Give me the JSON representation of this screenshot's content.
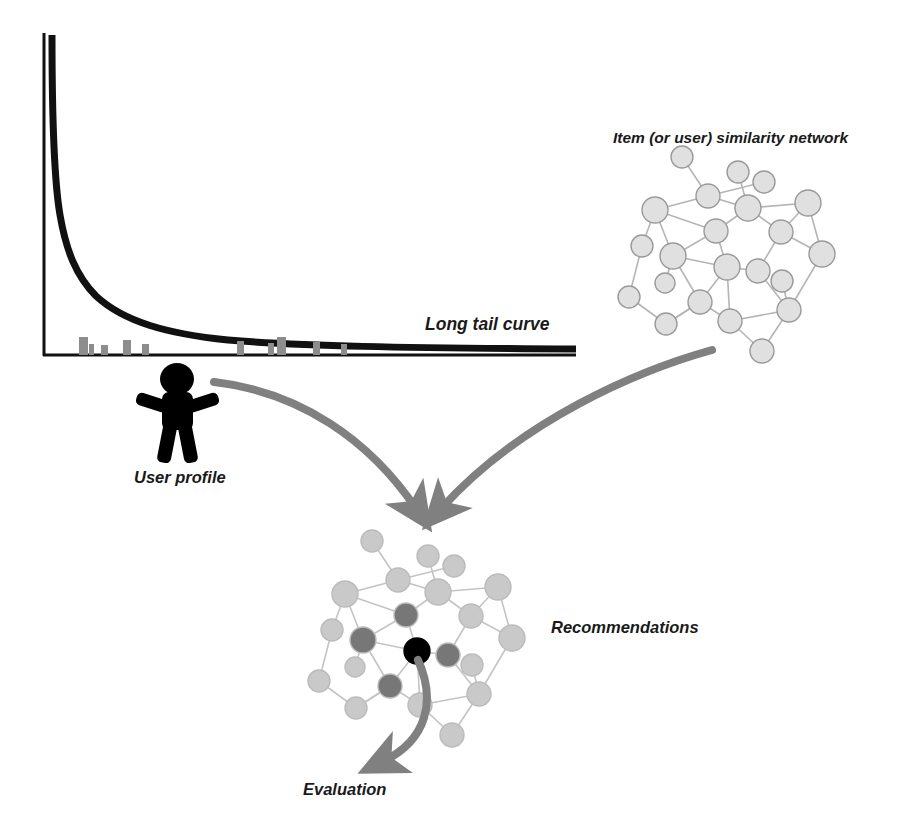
{
  "diagram": {
    "background_color": "#ffffff",
    "label_color": "#1a1a1a",
    "arrow_color": "#808080",
    "node_fill": "#e0e0e0",
    "node_stroke": "#9a9a9a",
    "node_fill_recommended": "#c9c9c9",
    "node_fill_highlight": "#777777",
    "node_fill_seed": "#000000",
    "edge_color": "#b5b5b5",
    "curve_color": "#111111",
    "bar_color": "#8d8d8d",
    "figure_color": "#000000"
  },
  "labels": {
    "long_tail_curve": "Long tail curve",
    "user_profile": "User profile",
    "similarity_network": "Item (or user) similarity network",
    "recommendations": "Recommendations",
    "evaluation": "Evaluation"
  },
  "chart_data": {
    "type": "line",
    "title": "Long tail curve",
    "xlabel": "",
    "ylabel": "",
    "grid": false,
    "legend": "none",
    "xlim": [
      0,
      100
    ],
    "ylim": [
      0,
      100
    ],
    "series": [
      {
        "name": "Long tail curve",
        "x": [
          1,
          2,
          3,
          4,
          5,
          6,
          8,
          10,
          13,
          17,
          22,
          28,
          35,
          45,
          58,
          72,
          85,
          100
        ],
        "y": [
          100,
          62,
          40,
          28,
          21,
          17,
          12,
          9.5,
          7.5,
          6.2,
          5.4,
          4.8,
          4.3,
          3.9,
          3.5,
          3.2,
          3.0,
          2.8
        ]
      }
    ],
    "histogram": {
      "name": "User profile ratings",
      "x": [
        8,
        10,
        14,
        21,
        25,
        43,
        50,
        52,
        64,
        71
      ],
      "values": [
        7.5,
        4.0,
        3.0,
        5.5,
        3.5,
        5.0,
        4.0,
        7.0,
        4.5,
        3.5
      ]
    }
  },
  "similarity_network": {
    "name": "Item (or user) similarity network",
    "node_count": 22,
    "nodes": [
      {
        "id": 0,
        "x": 682,
        "y": 157,
        "r": 11,
        "state": "normal"
      },
      {
        "id": 1,
        "x": 738,
        "y": 172,
        "r": 11,
        "state": "normal"
      },
      {
        "id": 2,
        "x": 708,
        "y": 196,
        "r": 12,
        "state": "normal"
      },
      {
        "id": 3,
        "x": 764,
        "y": 182,
        "r": 11,
        "state": "normal"
      },
      {
        "id": 4,
        "x": 655,
        "y": 210,
        "r": 13,
        "state": "normal"
      },
      {
        "id": 5,
        "x": 748,
        "y": 208,
        "r": 13,
        "state": "normal"
      },
      {
        "id": 6,
        "x": 808,
        "y": 203,
        "r": 13,
        "state": "normal"
      },
      {
        "id": 7,
        "x": 716,
        "y": 231,
        "r": 12,
        "state": "normal"
      },
      {
        "id": 8,
        "x": 781,
        "y": 232,
        "r": 12,
        "state": "normal"
      },
      {
        "id": 9,
        "x": 642,
        "y": 246,
        "r": 11,
        "state": "normal"
      },
      {
        "id": 10,
        "x": 673,
        "y": 256,
        "r": 13,
        "state": "normal"
      },
      {
        "id": 11,
        "x": 727,
        "y": 267,
        "r": 13,
        "state": "normal"
      },
      {
        "id": 12,
        "x": 758,
        "y": 271,
        "r": 12,
        "state": "normal"
      },
      {
        "id": 13,
        "x": 822,
        "y": 254,
        "r": 13,
        "state": "normal"
      },
      {
        "id": 14,
        "x": 665,
        "y": 283,
        "r": 10,
        "state": "normal"
      },
      {
        "id": 15,
        "x": 629,
        "y": 297,
        "r": 11,
        "state": "normal"
      },
      {
        "id": 16,
        "x": 700,
        "y": 302,
        "r": 12,
        "state": "normal"
      },
      {
        "id": 17,
        "x": 782,
        "y": 281,
        "r": 11,
        "state": "normal"
      },
      {
        "id": 18,
        "x": 789,
        "y": 310,
        "r": 12,
        "state": "normal"
      },
      {
        "id": 19,
        "x": 666,
        "y": 324,
        "r": 11,
        "state": "normal"
      },
      {
        "id": 20,
        "x": 730,
        "y": 321,
        "r": 12,
        "state": "normal"
      },
      {
        "id": 21,
        "x": 762,
        "y": 351,
        "r": 12,
        "state": "normal"
      }
    ],
    "edges": [
      [
        0,
        2
      ],
      [
        2,
        3
      ],
      [
        2,
        4
      ],
      [
        2,
        5
      ],
      [
        1,
        5
      ],
      [
        5,
        6
      ],
      [
        5,
        8
      ],
      [
        6,
        8
      ],
      [
        6,
        13
      ],
      [
        8,
        13
      ],
      [
        8,
        12
      ],
      [
        4,
        10
      ],
      [
        4,
        9
      ],
      [
        9,
        15
      ],
      [
        15,
        19
      ],
      [
        10,
        14
      ],
      [
        10,
        11
      ],
      [
        10,
        16
      ],
      [
        5,
        7
      ],
      [
        7,
        11
      ],
      [
        7,
        10
      ],
      [
        11,
        12
      ],
      [
        11,
        16
      ],
      [
        12,
        18
      ],
      [
        16,
        19
      ],
      [
        16,
        20
      ],
      [
        11,
        20
      ],
      [
        20,
        18
      ],
      [
        18,
        13
      ],
      [
        17,
        18
      ],
      [
        18,
        21
      ],
      [
        20,
        21
      ],
      [
        19,
        16
      ],
      [
        7,
        4
      ]
    ]
  },
  "recommendation_network": {
    "name": "Recommendations network",
    "node_count": 22,
    "nodes": [
      {
        "id": 0,
        "x": 372,
        "y": 541,
        "r": 11,
        "state": "normal"
      },
      {
        "id": 1,
        "x": 428,
        "y": 556,
        "r": 11,
        "state": "normal"
      },
      {
        "id": 2,
        "x": 398,
        "y": 580,
        "r": 12,
        "state": "normal"
      },
      {
        "id": 3,
        "x": 454,
        "y": 566,
        "r": 11,
        "state": "normal"
      },
      {
        "id": 4,
        "x": 345,
        "y": 594,
        "r": 13,
        "state": "normal"
      },
      {
        "id": 5,
        "x": 438,
        "y": 592,
        "r": 13,
        "state": "normal"
      },
      {
        "id": 6,
        "x": 498,
        "y": 587,
        "r": 13,
        "state": "normal"
      },
      {
        "id": 7,
        "x": 406,
        "y": 615,
        "r": 12,
        "state": "highlight"
      },
      {
        "id": 8,
        "x": 471,
        "y": 616,
        "r": 12,
        "state": "normal"
      },
      {
        "id": 9,
        "x": 332,
        "y": 630,
        "r": 11,
        "state": "normal"
      },
      {
        "id": 10,
        "x": 363,
        "y": 640,
        "r": 13,
        "state": "highlight"
      },
      {
        "id": 11,
        "x": 417,
        "y": 651,
        "r": 13,
        "state": "seed"
      },
      {
        "id": 12,
        "x": 448,
        "y": 655,
        "r": 12,
        "state": "highlight"
      },
      {
        "id": 13,
        "x": 512,
        "y": 638,
        "r": 13,
        "state": "normal"
      },
      {
        "id": 14,
        "x": 355,
        "y": 667,
        "r": 10,
        "state": "normal"
      },
      {
        "id": 15,
        "x": 319,
        "y": 681,
        "r": 11,
        "state": "normal"
      },
      {
        "id": 16,
        "x": 390,
        "y": 686,
        "r": 12,
        "state": "highlight"
      },
      {
        "id": 17,
        "x": 472,
        "y": 665,
        "r": 11,
        "state": "normal"
      },
      {
        "id": 18,
        "x": 479,
        "y": 694,
        "r": 12,
        "state": "normal"
      },
      {
        "id": 19,
        "x": 356,
        "y": 708,
        "r": 11,
        "state": "normal"
      },
      {
        "id": 20,
        "x": 420,
        "y": 705,
        "r": 12,
        "state": "normal"
      },
      {
        "id": 21,
        "x": 452,
        "y": 735,
        "r": 12,
        "state": "normal"
      }
    ],
    "edges": [
      [
        0,
        2
      ],
      [
        2,
        3
      ],
      [
        2,
        4
      ],
      [
        2,
        5
      ],
      [
        1,
        5
      ],
      [
        5,
        6
      ],
      [
        5,
        8
      ],
      [
        6,
        8
      ],
      [
        6,
        13
      ],
      [
        8,
        13
      ],
      [
        8,
        12
      ],
      [
        4,
        10
      ],
      [
        4,
        9
      ],
      [
        9,
        15
      ],
      [
        15,
        19
      ],
      [
        10,
        14
      ],
      [
        10,
        11
      ],
      [
        10,
        16
      ],
      [
        5,
        7
      ],
      [
        7,
        11
      ],
      [
        7,
        10
      ],
      [
        11,
        12
      ],
      [
        11,
        16
      ],
      [
        12,
        18
      ],
      [
        16,
        19
      ],
      [
        16,
        20
      ],
      [
        11,
        20
      ],
      [
        20,
        18
      ],
      [
        18,
        13
      ],
      [
        17,
        18
      ],
      [
        18,
        21
      ],
      [
        20,
        21
      ],
      [
        19,
        16
      ],
      [
        7,
        4
      ]
    ],
    "highlighted_nodes": [
      7,
      10,
      12,
      16
    ],
    "seed_node": 11
  },
  "arrows": [
    {
      "name": "user-profile-to-recommendations",
      "from": "User profile",
      "to": "Recommendations"
    },
    {
      "name": "similarity-network-to-recommendations",
      "from": "Item (or user) similarity network",
      "to": "Recommendations"
    },
    {
      "name": "recommendations-to-evaluation",
      "from": "Recommendations",
      "to": "Evaluation"
    }
  ]
}
